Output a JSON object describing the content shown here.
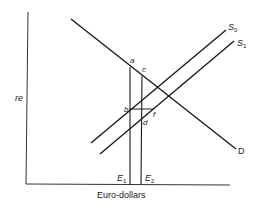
{
  "diagram": {
    "type": "supply-demand",
    "y_axis_label": "re",
    "x_axis_label": "Euro-dollars",
    "curves": {
      "demand": {
        "label": "D"
      },
      "supply_0": {
        "label": "S",
        "sub": "0"
      },
      "supply_1": {
        "label": "S",
        "sub": "1"
      }
    },
    "verticals": {
      "e1": {
        "label": "E",
        "sub": "1"
      },
      "e2": {
        "label": "E",
        "sub": "2"
      }
    },
    "points": {
      "a": "a",
      "b": "b",
      "c": "c",
      "d": "d",
      "f": "f"
    },
    "colors": {
      "line": "#1a1a1a",
      "background": "#ffffff"
    }
  }
}
